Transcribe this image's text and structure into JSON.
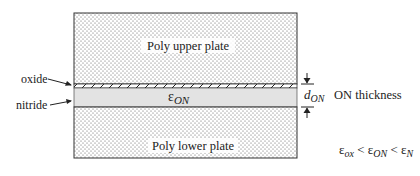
{
  "diagram": {
    "upper_plate_label": "Poly upper plate",
    "lower_plate_label": "Poly lower plate",
    "dielectric_symbol": "ε",
    "dielectric_subscript": "ON",
    "oxide_label": "oxide",
    "nitride_label": "nitride",
    "thickness_symbol": "d",
    "thickness_subscript": "ON",
    "thickness_label": "ON thickness",
    "relation": {
      "t1": "ε",
      "s1": "ox",
      "op1": " < ",
      "t2": "ε",
      "s2": "ON",
      "op2": " < ",
      "t3": "ε",
      "s3": "N"
    }
  },
  "colors": {
    "nitride_fill": "#e3e3e3",
    "dot_color": "#555555",
    "outline": "#333333"
  }
}
